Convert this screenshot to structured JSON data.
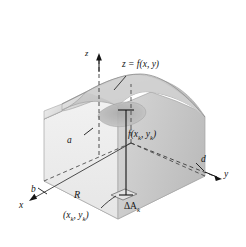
{
  "figure": {
    "kind": "3d-solid-under-surface",
    "background_color": "#ffffff",
    "ink_color": "#141414"
  },
  "axes": {
    "z": {
      "label": "z",
      "arrow": "up"
    },
    "x": {
      "label": "x",
      "arrow": "down-left"
    },
    "y": {
      "label": "y",
      "arrow": "right"
    }
  },
  "labels": {
    "surface": {
      "text": "z = f(x, y)",
      "leader": true
    },
    "dimension_a": "a",
    "dimension_b": "b",
    "dimension_d": "d",
    "region": "R",
    "height": {
      "base": "f(x",
      "sub1": "k",
      "mid": ", y",
      "sub2": "k",
      "close": ")"
    },
    "base_area": {
      "base": "ΔA",
      "sub": "k"
    },
    "sample_point": {
      "open": "(x",
      "sub1": "k",
      "mid": ", y",
      "sub2": "k",
      "close": ")"
    }
  },
  "colors": {
    "surface_top_light": "#dcdcdc",
    "surface_top_mid": "#c9c9c9",
    "surface_top_dark": "#b4b4b4",
    "front_face": "#efefef",
    "right_face": "#cfcfcf",
    "left_face": "#e4e4e4",
    "base_plane": "#f4f4f4",
    "outline": "#9a9a9a",
    "ink": "#141414"
  }
}
